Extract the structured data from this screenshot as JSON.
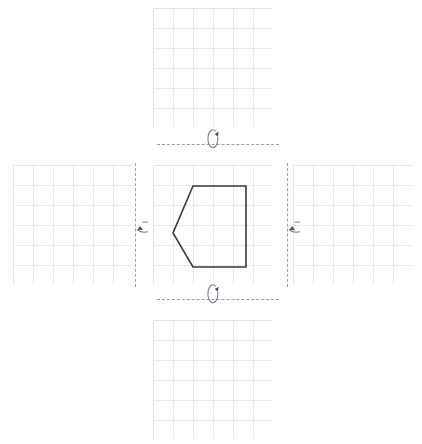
{
  "figure": {
    "title": "",
    "background_color": "#ffffff",
    "grid_line_color": "#e9eaee",
    "grid_border_color": "#e4e5ea",
    "axis_dash_color": "#9aa0b0",
    "shape_stroke_color": "#3a3a3a",
    "icon_color": "#7a7f8c"
  },
  "layout": {
    "arrangement": "cross",
    "panel_count": 5,
    "grid_rows": 6,
    "grid_cols": 6,
    "cell_size_px": 20
  },
  "panels": [
    {
      "id": "panel-top",
      "position_label": "top",
      "x": 153,
      "y": 8,
      "width": 120,
      "height": 120,
      "has_shape": false,
      "shape": null
    },
    {
      "id": "panel-left",
      "position_label": "left",
      "x": 13,
      "y": 165,
      "width": 120,
      "height": 120,
      "has_shape": false,
      "shape": null
    },
    {
      "id": "panel-center",
      "position_label": "center",
      "x": 153,
      "y": 165,
      "width": 120,
      "height": 120,
      "has_shape": true,
      "shape": {
        "name": "pentagon",
        "vertices": [
          [
            40,
            21
          ],
          [
            93,
            21
          ],
          [
            93,
            102
          ],
          [
            40,
            102
          ],
          [
            20,
            68
          ]
        ],
        "closed": true,
        "stroke_width": 1.6,
        "fill": "none"
      }
    },
    {
      "id": "panel-right",
      "position_label": "right",
      "x": 293,
      "y": 165,
      "width": 120,
      "height": 120,
      "has_shape": false,
      "shape": null
    },
    {
      "id": "panel-bottom",
      "position_label": "bottom",
      "x": 153,
      "y": 320,
      "width": 120,
      "height": 120,
      "has_shape": false,
      "shape": null
    }
  ],
  "axes": [
    {
      "id": "axis-top",
      "orientation": "horizontal",
      "x": 157,
      "y": 144,
      "length": 122,
      "label": ""
    },
    {
      "id": "axis-bottom",
      "orientation": "horizontal",
      "x": 157,
      "y": 299,
      "length": 122,
      "label": ""
    },
    {
      "id": "axis-left",
      "orientation": "vertical",
      "x": 135,
      "y": 163,
      "length": 124,
      "label": ""
    },
    {
      "id": "axis-right",
      "orientation": "vertical",
      "x": 287,
      "y": 163,
      "length": 124,
      "label": ""
    }
  ],
  "rotation_icons": [
    {
      "id": "rotation-icon-top",
      "icon_name": "rotate-arrow-icon",
      "axis": "axis-top",
      "orientation": "vertical-loop",
      "cx": 213,
      "cy": 139,
      "rx": 5,
      "ry": 9
    },
    {
      "id": "rotation-icon-bottom",
      "icon_name": "rotate-arrow-icon",
      "axis": "axis-bottom",
      "orientation": "vertical-loop",
      "cx": 213,
      "cy": 294,
      "rx": 5,
      "ry": 9
    },
    {
      "id": "rotation-icon-left",
      "icon_name": "rotate-arrow-icon",
      "axis": "axis-left",
      "orientation": "horizontal-loop",
      "cx": 135,
      "cy": 225,
      "rx": 9,
      "ry": 5
    },
    {
      "id": "rotation-icon-right",
      "icon_name": "rotate-arrow-icon",
      "axis": "axis-right",
      "orientation": "horizontal-loop",
      "cx": 287,
      "cy": 225,
      "rx": 9,
      "ry": 5
    }
  ]
}
